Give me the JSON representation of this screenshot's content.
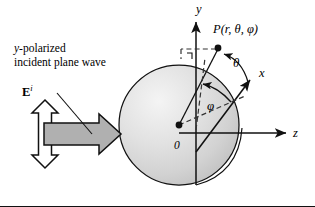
{
  "figure": {
    "title_text": "Spherical coordinate geometry for a sphere illuminated by a y-polarized incident plane wave",
    "background": "#ffffff",
    "border_color": "#111111"
  },
  "caption": {
    "line1_prefix": "y",
    "line1_rest": "-polarized",
    "line2": "incident plane wave"
  },
  "labels": {
    "y_axis": "y",
    "x_axis": "x",
    "z_axis": "z",
    "origin": "0",
    "point_P": "P(r, θ, φ)",
    "theta": "θ",
    "phi": "φ",
    "E_field_base": "E",
    "E_field_sup": "i"
  },
  "sphere": {
    "center_x": 179,
    "center_y": 125,
    "radius": 60,
    "fill_light": "#f2f2f2",
    "fill_dark": "#c9c9c9",
    "stroke": "#111111"
  },
  "arrows": {
    "polarization_arrow_name": "vertical double-headed white arrow",
    "polarization_fill": "#ffffff",
    "polarization_stroke": "#111111",
    "propagation_arrow_name": "horizontal gray block arrow",
    "propagation_fill": "#b0b0b0",
    "propagation_stroke": "#111111"
  },
  "colors": {
    "ink": "#111111",
    "dashed": "#333333"
  }
}
